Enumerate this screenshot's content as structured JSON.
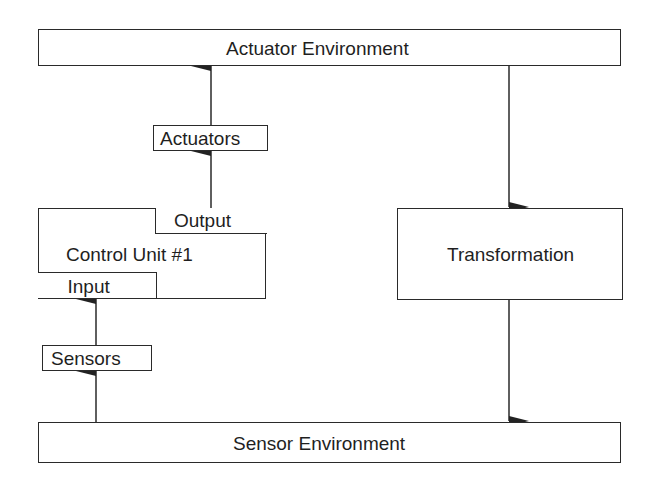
{
  "diagram": {
    "actuator_environment": "Actuator Environment",
    "actuators": "Actuators",
    "control_unit": "Control Unit #1",
    "output": "Output",
    "input": "Input",
    "sensors": "Sensors",
    "transformation": "Transformation",
    "sensor_environment": "Sensor Environment"
  },
  "edges": [
    {
      "from": "sensor_environment",
      "to": "sensors"
    },
    {
      "from": "sensors",
      "to": "input"
    },
    {
      "from": "output",
      "to": "actuators"
    },
    {
      "from": "actuators",
      "to": "actuator_environment"
    },
    {
      "from": "actuator_environment",
      "to": "transformation"
    },
    {
      "from": "transformation",
      "to": "sensor_environment"
    }
  ],
  "colors": {
    "line": "#2a2a2a",
    "background": "#ffffff"
  }
}
